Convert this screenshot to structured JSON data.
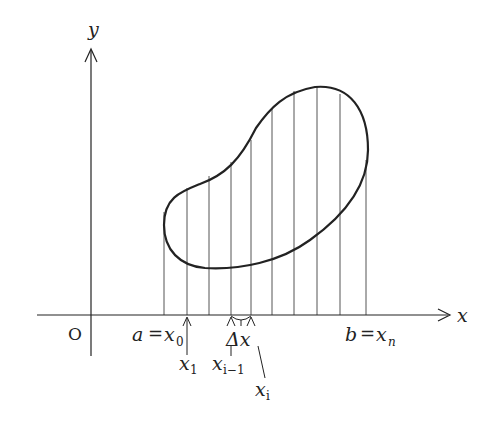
{
  "diagram": {
    "axes": {
      "x_label": "x",
      "y_label": "y",
      "origin_label": "O"
    },
    "labels": {
      "a": "a",
      "x0": "x",
      "x0_sub": "0",
      "b": "b",
      "xn": "x",
      "xn_sub": "n",
      "x1": "x",
      "x1_sub": "1",
      "xim1": "x",
      "xim1_sub": "i−1",
      "xi": "x",
      "xi_sub": "i",
      "delta": "Δx",
      "eq": "="
    },
    "partition_count": 10,
    "colors": {
      "stroke": "#222222",
      "thin": "#555555"
    }
  }
}
